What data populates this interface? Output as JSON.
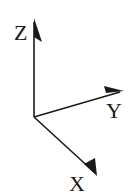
{
  "diagram": {
    "type": "3d-coordinate-axes",
    "origin": {
      "x": 34,
      "y": 117
    },
    "colors": {
      "stroke": "#1a1a1a",
      "background": "#ffffff"
    },
    "axes": [
      {
        "name": "Z",
        "label": "Z",
        "direction": "up",
        "tip": {
          "x": 34,
          "y": 19
        }
      },
      {
        "name": "Y",
        "label": "Y",
        "direction": "right",
        "tip": {
          "x": 123,
          "y": 91
        }
      },
      {
        "name": "X",
        "label": "X",
        "direction": "down-right",
        "tip": {
          "x": 97,
          "y": 176
        }
      }
    ]
  }
}
